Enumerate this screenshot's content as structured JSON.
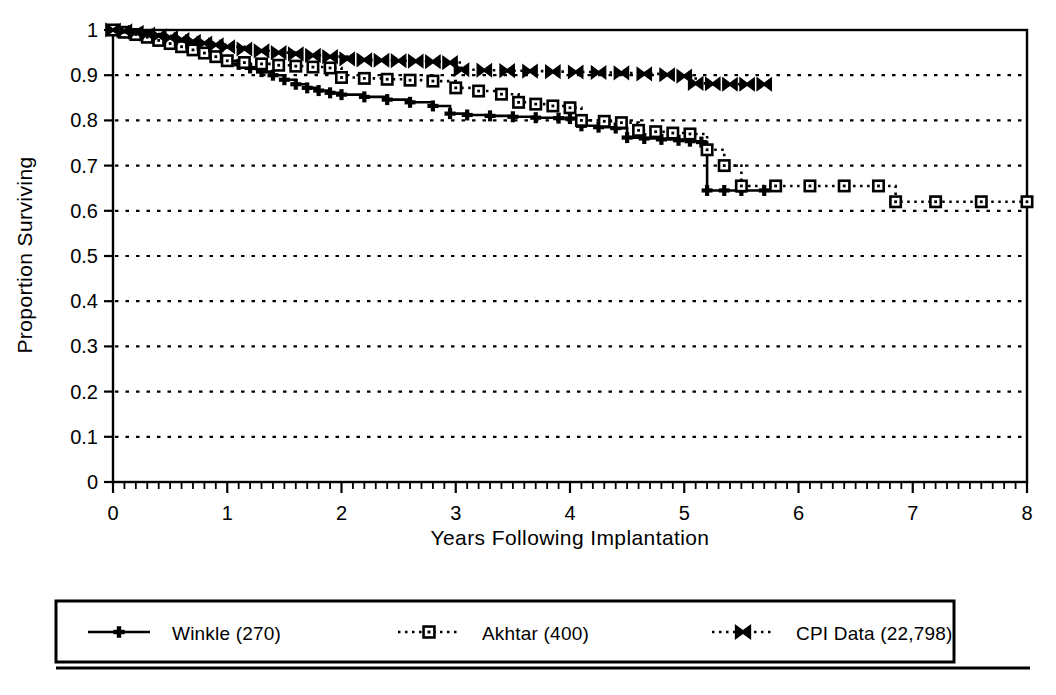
{
  "chart_data": {
    "type": "line",
    "title": "",
    "xlabel": "Years Following Implantation",
    "ylabel": "Proportion Surviving",
    "xlim": [
      0,
      8
    ],
    "ylim": [
      0,
      1
    ],
    "xticks": [
      0,
      1,
      2,
      3,
      4,
      5,
      6,
      7,
      8
    ],
    "xtick_labels": [
      "0",
      "1",
      "2",
      "3",
      "4",
      "5",
      "6",
      "7",
      "8"
    ],
    "yticks": [
      0,
      0.1,
      0.2,
      0.3,
      0.4,
      0.5,
      0.6,
      0.7,
      0.8,
      0.9,
      1
    ],
    "ytick_labels": [
      "0",
      "0.1",
      "0.2",
      "0.3",
      "0.4",
      "0.5",
      "0.6",
      "0.7",
      "0.8",
      "0.9",
      "1"
    ],
    "grid": "horizontal-dotted",
    "minor_xticks": true,
    "legend_position": "below-plot-boxed",
    "plot_style": "step-function survival curves, monochrome scanned figure",
    "series": [
      {
        "name": "Winkle (270)",
        "label": "Winkle (270)",
        "n": 270,
        "line_style": "solid",
        "marker": "plus",
        "color": "#000000",
        "x_end": 5.7,
        "points": [
          [
            0.0,
            1.0
          ],
          [
            0.1,
            0.996
          ],
          [
            0.2,
            0.992
          ],
          [
            0.3,
            0.986
          ],
          [
            0.4,
            0.98
          ],
          [
            0.5,
            0.973
          ],
          [
            0.6,
            0.966
          ],
          [
            0.7,
            0.958
          ],
          [
            0.8,
            0.95
          ],
          [
            0.9,
            0.941
          ],
          [
            1.0,
            0.932
          ],
          [
            1.1,
            0.924
          ],
          [
            1.2,
            0.916
          ],
          [
            1.3,
            0.908
          ],
          [
            1.4,
            0.9
          ],
          [
            1.5,
            0.89
          ],
          [
            1.6,
            0.88
          ],
          [
            1.7,
            0.872
          ],
          [
            1.8,
            0.866
          ],
          [
            1.9,
            0.861
          ],
          [
            2.0,
            0.857
          ],
          [
            2.2,
            0.852
          ],
          [
            2.4,
            0.846
          ],
          [
            2.6,
            0.84
          ],
          [
            2.8,
            0.832
          ],
          [
            2.95,
            0.815
          ],
          [
            3.1,
            0.812
          ],
          [
            3.3,
            0.81
          ],
          [
            3.5,
            0.808
          ],
          [
            3.7,
            0.806
          ],
          [
            3.9,
            0.805
          ],
          [
            4.0,
            0.804
          ],
          [
            4.1,
            0.788
          ],
          [
            4.25,
            0.785
          ],
          [
            4.4,
            0.783
          ],
          [
            4.5,
            0.762
          ],
          [
            4.65,
            0.76
          ],
          [
            4.8,
            0.758
          ],
          [
            4.95,
            0.756
          ],
          [
            5.05,
            0.754
          ],
          [
            5.15,
            0.752
          ],
          [
            5.2,
            0.645
          ],
          [
            5.35,
            0.645
          ],
          [
            5.5,
            0.645
          ],
          [
            5.7,
            0.645
          ]
        ]
      },
      {
        "name": "Akhtar (400)",
        "label": "Akhtar (400)",
        "n": 400,
        "line_style": "dotted",
        "marker": "open-square",
        "color": "#000000",
        "x_end": 8.0,
        "points": [
          [
            0.0,
            1.0
          ],
          [
            0.1,
            0.995
          ],
          [
            0.2,
            0.99
          ],
          [
            0.3,
            0.984
          ],
          [
            0.4,
            0.977
          ],
          [
            0.5,
            0.97
          ],
          [
            0.6,
            0.963
          ],
          [
            0.7,
            0.956
          ],
          [
            0.8,
            0.949
          ],
          [
            0.9,
            0.941
          ],
          [
            1.0,
            0.932
          ],
          [
            1.15,
            0.928
          ],
          [
            1.3,
            0.925
          ],
          [
            1.45,
            0.922
          ],
          [
            1.6,
            0.92
          ],
          [
            1.75,
            0.918
          ],
          [
            1.9,
            0.916
          ],
          [
            2.0,
            0.895
          ],
          [
            2.2,
            0.893
          ],
          [
            2.4,
            0.891
          ],
          [
            2.6,
            0.889
          ],
          [
            2.8,
            0.887
          ],
          [
            3.0,
            0.872
          ],
          [
            3.2,
            0.865
          ],
          [
            3.4,
            0.858
          ],
          [
            3.55,
            0.84
          ],
          [
            3.7,
            0.836
          ],
          [
            3.85,
            0.832
          ],
          [
            4.0,
            0.828
          ],
          [
            4.1,
            0.8
          ],
          [
            4.3,
            0.798
          ],
          [
            4.45,
            0.795
          ],
          [
            4.6,
            0.778
          ],
          [
            4.75,
            0.775
          ],
          [
            4.9,
            0.772
          ],
          [
            5.05,
            0.77
          ],
          [
            5.2,
            0.735
          ],
          [
            5.35,
            0.7
          ],
          [
            5.5,
            0.655
          ],
          [
            5.8,
            0.655
          ],
          [
            6.1,
            0.655
          ],
          [
            6.4,
            0.655
          ],
          [
            6.7,
            0.655
          ],
          [
            6.85,
            0.62
          ],
          [
            7.2,
            0.62
          ],
          [
            7.6,
            0.62
          ],
          [
            8.0,
            0.62
          ]
        ]
      },
      {
        "name": "CPI Data (22,798)",
        "label": "CPI Data (22,798)",
        "n": 22798,
        "line_style": "dotted",
        "marker": "bowtie",
        "color": "#000000",
        "x_end": 5.7,
        "points": [
          [
            0.0,
            1.0
          ],
          [
            0.1,
            0.998
          ],
          [
            0.2,
            0.995
          ],
          [
            0.3,
            0.991
          ],
          [
            0.4,
            0.987
          ],
          [
            0.5,
            0.983
          ],
          [
            0.6,
            0.979
          ],
          [
            0.7,
            0.975
          ],
          [
            0.8,
            0.971
          ],
          [
            0.9,
            0.967
          ],
          [
            1.0,
            0.963
          ],
          [
            1.15,
            0.958
          ],
          [
            1.3,
            0.954
          ],
          [
            1.45,
            0.95
          ],
          [
            1.6,
            0.947
          ],
          [
            1.75,
            0.944
          ],
          [
            1.9,
            0.941
          ],
          [
            2.05,
            0.936
          ],
          [
            2.2,
            0.934
          ],
          [
            2.35,
            0.933
          ],
          [
            2.5,
            0.932
          ],
          [
            2.65,
            0.931
          ],
          [
            2.8,
            0.93
          ],
          [
            2.95,
            0.928
          ],
          [
            3.05,
            0.912
          ],
          [
            3.25,
            0.911
          ],
          [
            3.45,
            0.91
          ],
          [
            3.65,
            0.909
          ],
          [
            3.85,
            0.908
          ],
          [
            4.05,
            0.907
          ],
          [
            4.25,
            0.906
          ],
          [
            4.45,
            0.905
          ],
          [
            4.65,
            0.903
          ],
          [
            4.85,
            0.901
          ],
          [
            5.0,
            0.898
          ],
          [
            5.1,
            0.882
          ],
          [
            5.25,
            0.881
          ],
          [
            5.4,
            0.88
          ],
          [
            5.55,
            0.88
          ],
          [
            5.7,
            0.88
          ]
        ]
      }
    ]
  },
  "axes": {
    "ylabel": "Proportion Surviving",
    "xlabel": "Years Following Implantation"
  },
  "legend": {
    "items": [
      {
        "label": "Winkle (270)",
        "marker": "plus",
        "line_style": "solid"
      },
      {
        "label": "Akhtar (400)",
        "marker": "open-square",
        "line_style": "dotted"
      },
      {
        "label": "CPI Data (22,798)",
        "marker": "bowtie",
        "line_style": "dotted"
      }
    ]
  }
}
